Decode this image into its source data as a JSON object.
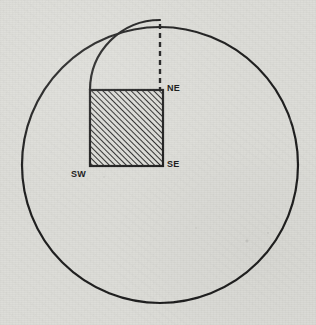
{
  "figure": {
    "background_color": "#dcdcd7",
    "ink_color": "#1e1e1e",
    "medium": "scanned-paper-halftone",
    "labels": [
      {
        "id": "ne",
        "text": "NE",
        "x": 167,
        "y": 84,
        "corner": "top-right"
      },
      {
        "id": "se",
        "text": "SE",
        "x": 167,
        "y": 160,
        "corner": "bottom-right"
      },
      {
        "id": "sw",
        "text": "SW",
        "x": 71,
        "y": 170,
        "corner": "bottom-left"
      }
    ],
    "shapes": {
      "large_circle": {
        "name": "large-circle",
        "cx": 160,
        "cy": 165,
        "r": 138,
        "stroke_width": 2.2,
        "fill": "none"
      },
      "small_arc": {
        "name": "small-arc",
        "cx": 160,
        "cy": 90,
        "r": 70,
        "stroke_width": 2.2,
        "start_angle_deg": 180,
        "end_angle_deg": 270,
        "path": "M 90 90 A 70 70 0 0 1 160 20"
      },
      "hatched_square": {
        "name": "hatched-square",
        "x": 90,
        "y": 90,
        "width": 73,
        "height": 76,
        "stroke_width": 2.2,
        "hatch_angle_deg": 45,
        "hatch_spacing": 4,
        "hatch_direction": "bottom-left-to-top-right"
      },
      "dashed_line": {
        "name": "dashed-radius-line",
        "x1": 160,
        "y1": 24,
        "x2": 160,
        "y2": 90,
        "stroke_width": 2.4,
        "dash_pattern": "5,4"
      }
    }
  }
}
